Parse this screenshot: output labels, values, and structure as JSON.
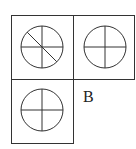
{
  "diagram": {
    "type": "figure-grid",
    "stroke_color": "#333333",
    "background": "#ffffff",
    "cells": [
      {
        "position": "top-left",
        "shape": "circle",
        "divisions": [
          "vertical",
          "horizontal",
          "diagonal-top-left-to-bottom-right"
        ]
      },
      {
        "position": "top-right",
        "shape": "circle",
        "divisions": [
          "vertical",
          "horizontal"
        ]
      },
      {
        "position": "bottom-left",
        "shape": "circle",
        "divisions": [
          "vertical",
          "horizontal"
        ]
      }
    ],
    "label": "B"
  }
}
